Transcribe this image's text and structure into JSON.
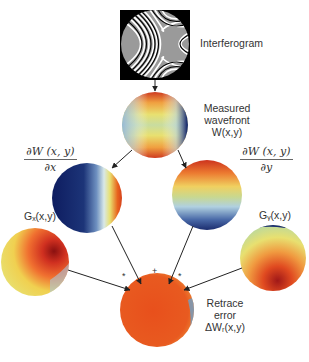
{
  "nodes": {
    "interferogram": {
      "label": "Interferogram"
    },
    "measured": {
      "line1": "Measured",
      "line2": "wavefront",
      "line3": "W(x,y)"
    },
    "dx": {
      "numerator": "∂W (x, y)",
      "denominator": "∂x"
    },
    "dy": {
      "numerator": "∂W (x, y)",
      "denominator": "∂y"
    },
    "gx": {
      "label": "Gₓ(x,y)"
    },
    "gy": {
      "label": "Gᵧ(x,y)"
    },
    "retrace": {
      "line1": "Retrace",
      "line2": "error",
      "line3": "ΔWᵣ(x,y)"
    }
  },
  "operators": {
    "left": "*",
    "center": "+",
    "right": "*"
  },
  "colors": {
    "dark_blue": "#0d1b5e",
    "red": "#c8281a",
    "orange": "#e8641e",
    "yellow": "#f0e060",
    "light_blue": "#a8c8e0",
    "arrow": "#222222"
  }
}
